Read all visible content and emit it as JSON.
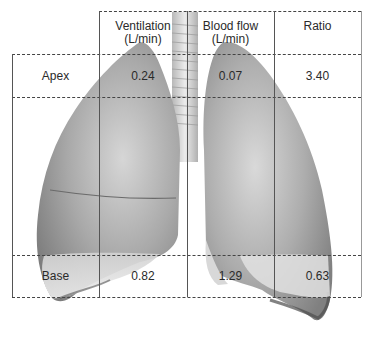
{
  "figure": {
    "columns": [
      {
        "label": "",
        "unit": ""
      },
      {
        "label": "Ventilation",
        "unit": "(L/min)"
      },
      {
        "label": "Blood flow",
        "unit": "(L/min)"
      },
      {
        "label": "Ratio",
        "unit": ""
      }
    ],
    "rows": [
      {
        "region": "Apex",
        "ventilation": "0.24",
        "blood_flow": "0.07",
        "ratio": "3.40"
      },
      {
        "region": "Base",
        "ventilation": "0.82",
        "blood_flow": "1.29",
        "ratio": "0.63"
      }
    ],
    "colors": {
      "grid": "#444444",
      "lung_light": "#e6e6e6",
      "lung_dark": "#8a8a8a",
      "trachea": "#d4d4d4"
    }
  }
}
